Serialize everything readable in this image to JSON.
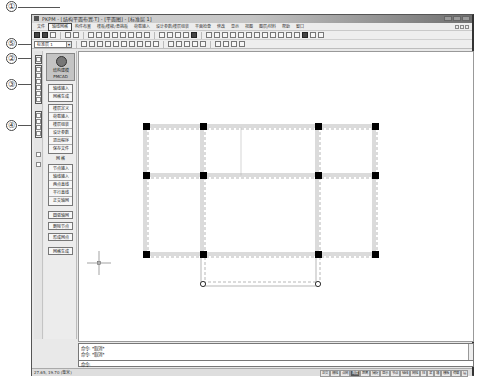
{
  "annotations": [
    {
      "label": "①",
      "target": "menu-tab-active"
    },
    {
      "label": "⑤",
      "target": "layer-select"
    },
    {
      "label": "②",
      "target": "vtoolbar-group-1"
    },
    {
      "label": "③",
      "target": "vtoolbar-group-2"
    },
    {
      "label": "④",
      "target": "vtoolbar-group-3"
    }
  ],
  "window": {
    "title": "PKPM - [结构平面布置.T]  - [平面图]  - [标准层 1]"
  },
  "menubar": {
    "items": [
      {
        "label": "文件",
        "active": false
      },
      {
        "label": "轴线网格",
        "active": true
      },
      {
        "label": "构件布置",
        "active": false
      },
      {
        "label": "楼板/楼梯/悬挑板",
        "active": false
      },
      {
        "label": "荷载输入",
        "active": false
      },
      {
        "label": "设计参数/楼层组装",
        "active": false
      },
      {
        "label": "平面检查",
        "active": false
      },
      {
        "label": "修改",
        "active": false
      },
      {
        "label": "显示",
        "active": false
      },
      {
        "label": "视图",
        "active": false
      },
      {
        "label": "图层/材料",
        "active": false
      },
      {
        "label": "帮助",
        "active": false
      },
      {
        "label": "窗口",
        "active": false
      }
    ]
  },
  "toolbar": {
    "layer_select_value": "标准层 1",
    "layer_select_arrow": "▾"
  },
  "sidepanel": {
    "logo_line1": "结构建模",
    "logo_line2": "PMCAD",
    "group1": [
      "轴线输入",
      "网格生成"
    ],
    "group2": [
      "楼层定义",
      "荷载输入",
      "楼层组装",
      "设计参数",
      "退出程序",
      "保存文件"
    ],
    "section_title": "网  格",
    "group3": [
      "节点输入",
      "轴线输入",
      "两点直线",
      "平行直线",
      "正交轴网",
      "圆弧轴网",
      "删除节点",
      "形成网点",
      "网格生成"
    ]
  },
  "drawing": {
    "columns_x": [
      145,
      202,
      317,
      374
    ],
    "rows_y": [
      126,
      175,
      254
    ],
    "hinge_row_y": 283,
    "hinge_x": [
      202,
      317
    ],
    "cursor": {
      "x": 98,
      "y": 262
    }
  },
  "command": {
    "history": [
      "命令: *取消*",
      "命令: *取消*"
    ],
    "prompt": "命令:"
  },
  "status": {
    "text": "27.65, 19.70  (毫米)",
    "buttons": [
      {
        "label": "正交",
        "on": false
      },
      {
        "label": "栅格",
        "on": false
      },
      {
        "label": "点网",
        "on": false
      },
      {
        "label": "角度",
        "on": true
      },
      {
        "label": "距离",
        "on": false
      },
      {
        "label": "捕捉",
        "on": false
      },
      {
        "label": "显示",
        "on": false
      },
      {
        "label": "节点",
        "on": false
      },
      {
        "label": "轴线",
        "on": false
      },
      {
        "label": "网格",
        "on": false
      },
      {
        "label": "柱",
        "on": false
      },
      {
        "label": "梁",
        "on": false
      },
      {
        "label": "墙",
        "on": false
      },
      {
        "label": "楼板",
        "on": false
      },
      {
        "label": "荷载",
        "on": false
      },
      {
        "label": "层",
        "on": false
      }
    ]
  }
}
